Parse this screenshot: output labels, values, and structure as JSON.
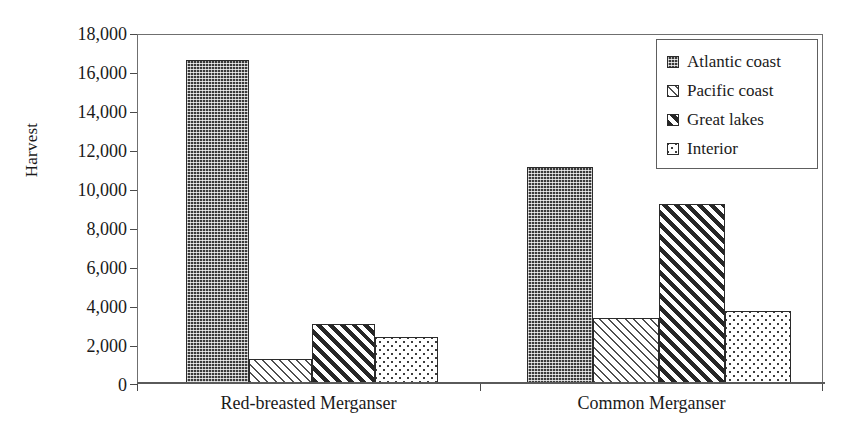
{
  "chart_data": {
    "type": "bar",
    "title": "",
    "xlabel": "",
    "ylabel": "Harvest",
    "ylim": [
      0,
      18000
    ],
    "ytick_values": [
      0,
      2000,
      4000,
      6000,
      8000,
      10000,
      12000,
      14000,
      16000,
      18000
    ],
    "ytick_labels": [
      "0",
      "2,000",
      "4,000",
      "6,000",
      "8,000",
      "10,000",
      "12,000",
      "14,000",
      "16,000",
      "18,000"
    ],
    "categories": [
      "Red-breasted Merganser",
      "Common Merganser"
    ],
    "grid": false,
    "legend_position": "top-right",
    "series": [
      {
        "name": "Atlantic coast",
        "pattern": "dark-checker",
        "values": [
          16600,
          11100
        ]
      },
      {
        "name": "Pacific coast",
        "pattern": "light-diagonal",
        "values": [
          1250,
          3350
        ]
      },
      {
        "name": "Great lakes",
        "pattern": "dark-diagonal",
        "values": [
          3050,
          9200
        ]
      },
      {
        "name": "Interior",
        "pattern": "light-dots",
        "values": [
          2350,
          3700
        ]
      }
    ]
  },
  "legend": {
    "items": [
      {
        "label": "Atlantic coast",
        "swatch": "swatch-atlantic-coast"
      },
      {
        "label": "Pacific coast",
        "swatch": "swatch-pacific-coast"
      },
      {
        "label": "Great lakes",
        "swatch": "swatch-great-lakes"
      },
      {
        "label": "Interior",
        "swatch": "swatch-interior"
      }
    ]
  },
  "colors": {
    "axis": "#5a5a5a",
    "text": "#1a1a1a",
    "bar_outline": "#2b2b2b",
    "background": "#ffffff"
  }
}
